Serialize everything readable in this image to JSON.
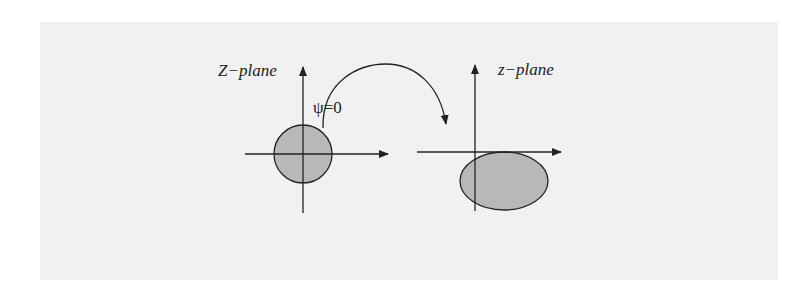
{
  "figure": {
    "left_panel": {
      "label": "Z−plane",
      "condition_label": "ψ=0",
      "shape": "circle",
      "fill_color": "#b8b8b8"
    },
    "right_panel": {
      "label": "z−plane",
      "shape": "ellipse",
      "fill_color": "#b8b8b8"
    },
    "mapping_arrow": "curved-arrow",
    "colors": {
      "background": "#f1f1f1",
      "stroke": "#222222"
    }
  }
}
